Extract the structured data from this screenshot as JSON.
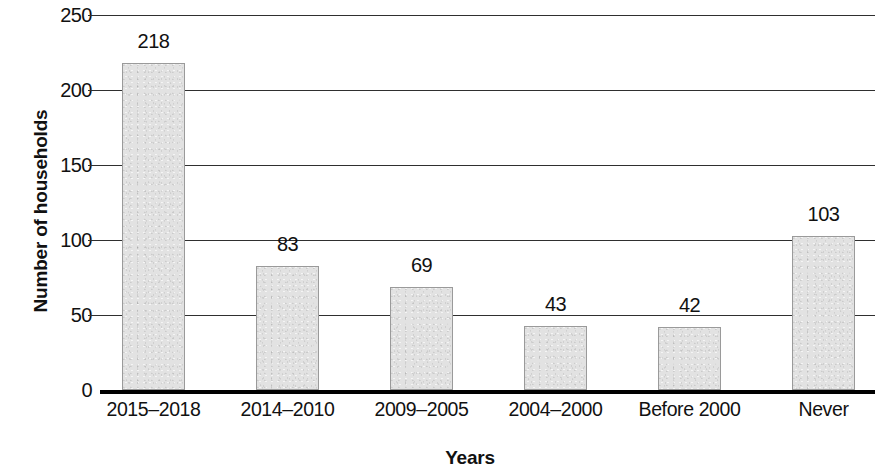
{
  "chart_data": {
    "type": "bar",
    "title": "",
    "xlabel": "Years",
    "ylabel": "Number of households",
    "categories": [
      "2015–2018",
      "2014–2010",
      "2009–2005",
      "2004–2000",
      "Before 2000",
      "Never"
    ],
    "values": [
      218,
      83,
      69,
      43,
      42,
      103
    ],
    "value_labels": [
      "218",
      "83",
      "69",
      "43",
      "42",
      "103"
    ],
    "ylim": [
      0,
      250
    ],
    "y_ticks": [
      0,
      50,
      100,
      150,
      200,
      250
    ],
    "y_tick_labels": [
      "0",
      "50",
      "100",
      "150",
      "200",
      "250"
    ],
    "grid": true,
    "grid_axis": "y",
    "legend": false,
    "legend_position": "none",
    "bar_fill_color": "#e2e2e2",
    "bar_edge_color": "#9a9a9a",
    "axis_color": "#000000",
    "gridline_color": "#2f2f2f",
    "text_color": "#111111",
    "background_color": "#ffffff"
  }
}
